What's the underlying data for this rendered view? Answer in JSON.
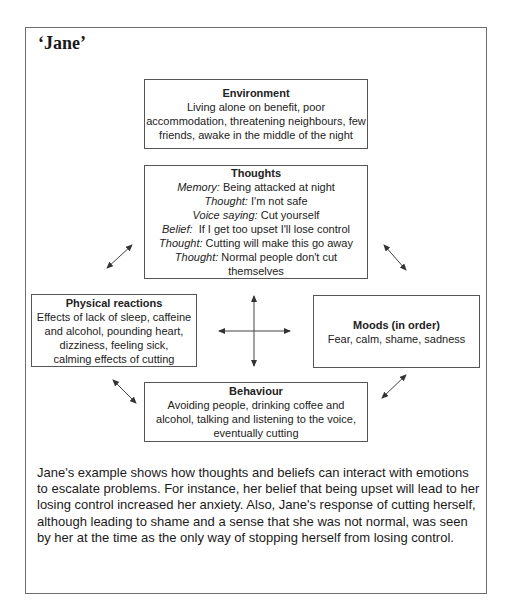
{
  "title": "‘Jane’",
  "boxes": {
    "environment": {
      "heading": "Environment",
      "lines": [
        "Living alone on benefit, poor",
        "accommodation, threatening neighbours, few",
        "friends, awake in the middle of the night"
      ]
    },
    "thoughts": {
      "heading": "Thoughts",
      "items": [
        {
          "label": "Memory:",
          "text": " Being attacked at night"
        },
        {
          "label": "Thought:",
          "text": " I'm not safe"
        },
        {
          "label": "Voice saying:",
          "text": " Cut yourself"
        },
        {
          "label": "Belief:",
          "text": "  If I get too upset I'll lose control"
        },
        {
          "label": "Thought:",
          "text": " Cutting will make this go away"
        },
        {
          "label": "Thought:",
          "text": " Normal people don't cut"
        },
        {
          "label": "",
          "text": "themselves"
        }
      ]
    },
    "physical": {
      "heading": "Physical reactions",
      "lines": [
        "Effects of lack of sleep, caffeine",
        "and alcohol, pounding heart,",
        "dizziness, feeling sick,",
        "calming effects of cutting"
      ]
    },
    "moods": {
      "heading": "Moods (in order)",
      "lines": [
        "Fear, calm, shame, sadness"
      ]
    },
    "behaviour": {
      "heading": "Behaviour",
      "lines": [
        "Avoiding people, drinking coffee and",
        "alcohol, talking and listening to the voice,",
        "eventually cutting"
      ]
    }
  },
  "paragraph": "Jane's example shows how thoughts and beliefs can interact with emotions to escalate problems. For instance, her belief that being upset will lead to her losing control increased her anxiety. Also, Jane's response of cutting herself, although leading to shame and a sense that she was not normal, was seen by her at the time as the only way of stopping herself from losing control.",
  "arrows": [
    {
      "name": "thoughts-physical",
      "x1": 107,
      "y1": 268,
      "x2": 132,
      "y2": 245
    },
    {
      "name": "thoughts-moods",
      "x1": 384,
      "y1": 245,
      "x2": 406,
      "y2": 270
    },
    {
      "name": "physical-behaviour",
      "x1": 113,
      "y1": 380,
      "x2": 136,
      "y2": 403
    },
    {
      "name": "moods-behaviour",
      "x1": 382,
      "y1": 398,
      "x2": 406,
      "y2": 375
    },
    {
      "name": "center-vertical",
      "x1": 254,
      "y1": 296,
      "x2": 254,
      "y2": 366
    },
    {
      "name": "center-horizontal",
      "x1": 219,
      "y1": 331,
      "x2": 290,
      "y2": 331
    }
  ]
}
